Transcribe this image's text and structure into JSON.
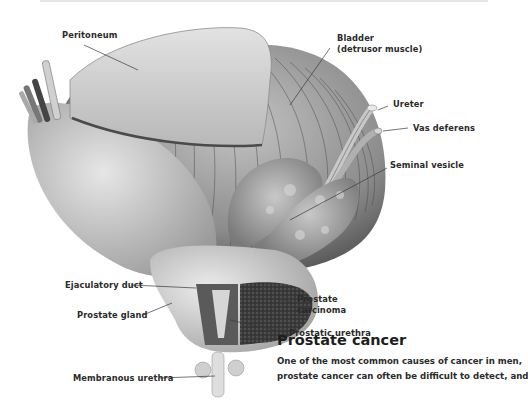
{
  "figure": {
    "labels": {
      "peritoneum": "Peritoneum",
      "bladder_line1": "Bladder",
      "bladder_line2": "(detrusor muscle)",
      "ureter": "Ureter",
      "vas_deferens": "Vas deferens",
      "seminal_vesicle": "Seminal vesicle",
      "ejaculatory_duct": "Ejaculatory duct",
      "prostate_gland": "Prostate gland",
      "prostate_carcinoma_line1": "Prostate",
      "prostate_carcinoma_line2": "carcinoma",
      "prostatic_urethra": "Prostatic urethra",
      "membranous_urethra": "Membranous urethra"
    },
    "colors": {
      "tissue_light": "#d9d9d9",
      "tissue_mid": "#a8a8a8",
      "tissue_dark": "#5a5a5a",
      "carcinoma": "#2e2e2e",
      "leader_line": "#3a3a3a"
    }
  },
  "article": {
    "heading": "Prostate cancer",
    "body_lines": [
      "One of the most common causes of cancer in men,",
      "prostate cancer can often be difficult to detect, and"
    ]
  }
}
